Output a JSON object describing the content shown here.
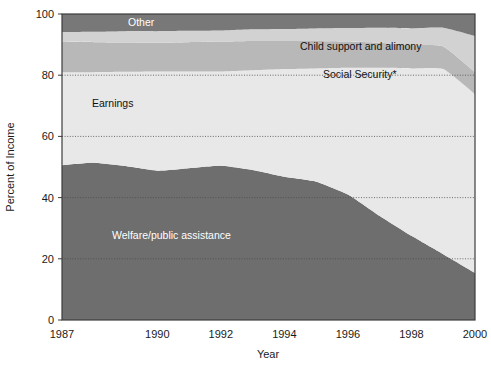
{
  "chart_data": {
    "type": "area",
    "stacked": true,
    "title": "",
    "xlabel": "Year",
    "ylabel": "Percent of Income",
    "xlim": [
      1987,
      2000
    ],
    "ylim": [
      0,
      100
    ],
    "grid": true,
    "legend_position": "inline-labels",
    "x": [
      1987,
      1988,
      1989,
      1990,
      1991,
      1992,
      1993,
      1994,
      1995,
      1996,
      1997,
      1998,
      1999,
      2000
    ],
    "xticks": [
      "1987",
      "1990",
      "1992",
      "1994",
      "1996",
      "1998",
      "2000"
    ],
    "xtick_values": [
      1987,
      1990,
      1992,
      1994,
      1996,
      1998,
      2000
    ],
    "yticks": [
      "0",
      "20",
      "40",
      "60",
      "80",
      "100"
    ],
    "ytick_values": [
      0,
      20,
      40,
      60,
      80,
      100
    ],
    "series": [
      {
        "name": "Welfare/public assistance",
        "color": "#6e6e6e",
        "label_color": "#ffffff",
        "values": [
          50.6,
          51.4,
          50.3,
          48.8,
          49.6,
          50.4,
          49.0,
          46.8,
          45.2,
          41.0,
          34.0,
          27.5,
          21.5,
          15.4
        ]
      },
      {
        "name": "Earnings",
        "color": "#e8e8e8",
        "label_color": "#111111",
        "values": [
          30.4,
          29.6,
          30.8,
          32.4,
          31.6,
          30.8,
          32.6,
          35.2,
          37.0,
          41.4,
          48.4,
          54.7,
          60.5,
          58.4
        ]
      },
      {
        "name": "Social Security*",
        "color": "#b8b8b8",
        "label_color": "#111111",
        "values": [
          10.0,
          9.8,
          9.6,
          9.4,
          9.6,
          9.8,
          9.6,
          9.2,
          9.0,
          8.6,
          8.2,
          7.6,
          7.4,
          7.2
        ]
      },
      {
        "name": "Child support and alimony",
        "color": "#d2d2d2",
        "label_color": "#111111",
        "values": [
          3.1,
          3.4,
          3.7,
          3.8,
          3.7,
          3.6,
          3.8,
          3.9,
          4.1,
          4.4,
          4.9,
          5.5,
          6.1,
          11.8
        ]
      },
      {
        "name": "Other",
        "color": "#787878",
        "label_color": "#ffffff",
        "values": [
          5.9,
          5.8,
          5.6,
          5.6,
          5.5,
          5.4,
          5.0,
          4.9,
          4.7,
          4.6,
          4.5,
          4.7,
          4.5,
          7.2
        ]
      }
    ],
    "series_labels": [
      {
        "text": "Other",
        "x": 128,
        "y": 26,
        "tone": "dark"
      },
      {
        "text": "Child support and alimony",
        "x": 300,
        "y": 50,
        "tone": "light"
      },
      {
        "text": "Social Security*",
        "x": 323,
        "y": 78,
        "tone": "light"
      },
      {
        "text": "Earnings",
        "x": 92,
        "y": 107,
        "tone": "light"
      },
      {
        "text": "Welfare/public assistance",
        "x": 112,
        "y": 239,
        "tone": "dark"
      }
    ]
  },
  "axes": {
    "y_axis_title": "Percent of Income",
    "x_axis_title": "Year"
  },
  "colors": {
    "background": "#ffffff",
    "axis_line": "#3c3c3c",
    "gridline": "#5a5a5a",
    "text": "#1a1a1a"
  }
}
